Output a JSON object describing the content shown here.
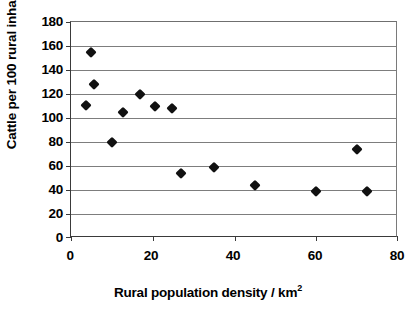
{
  "chart_data": {
    "type": "scatter",
    "title": "",
    "xlabel": "Rural population density / km²",
    "xlabel_main": "Rural population density / km",
    "xlabel_sup": "2",
    "ylabel": "Cattle per 100 rural inhabitants",
    "xlim": [
      0,
      80
    ],
    "ylim": [
      0,
      180
    ],
    "xticks": [
      0,
      20,
      40,
      60,
      80
    ],
    "yticks": [
      0,
      20,
      40,
      60,
      80,
      100,
      120,
      140,
      160,
      180
    ],
    "grid": "horizontal",
    "legend": "none",
    "marker": "diamond",
    "marker_color": "#111111",
    "series": [
      {
        "name": "Cattle per 100 rural inhabitants",
        "points": [
          {
            "x": 3.7,
            "y": 111
          },
          {
            "x": 5.0,
            "y": 155
          },
          {
            "x": 5.7,
            "y": 128
          },
          {
            "x": 10.0,
            "y": 80
          },
          {
            "x": 12.8,
            "y": 105
          },
          {
            "x": 17.0,
            "y": 120
          },
          {
            "x": 20.5,
            "y": 110
          },
          {
            "x": 24.7,
            "y": 108
          },
          {
            "x": 27.0,
            "y": 54
          },
          {
            "x": 35.0,
            "y": 59
          },
          {
            "x": 45.0,
            "y": 44
          },
          {
            "x": 60.0,
            "y": 39
          },
          {
            "x": 70.0,
            "y": 74
          },
          {
            "x": 72.5,
            "y": 39
          }
        ]
      }
    ]
  },
  "axis": {
    "y_tick_labels": [
      "180",
      "160",
      "140",
      "120",
      "100",
      "80",
      "60",
      "40",
      "20",
      "0"
    ],
    "x_tick_labels": [
      "0",
      "20",
      "40",
      "60",
      "80"
    ]
  },
  "colors": {
    "marker": "#111111",
    "gridline": "#7d7d7d",
    "axis": "#3a3a3a",
    "background": "#ffffff"
  }
}
